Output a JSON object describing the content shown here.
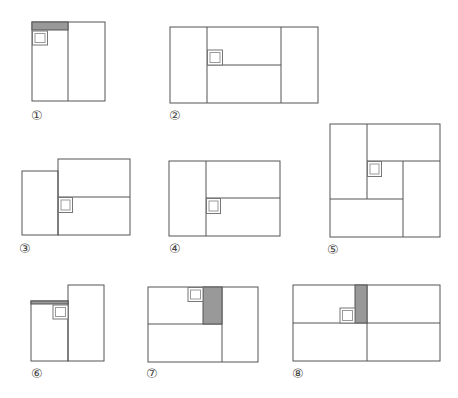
{
  "figures": [
    {
      "label": "①",
      "description": "Two vertical panels with shaded strip across top of left panel and small double square beneath it"
    },
    {
      "label": "②",
      "description": "Three vertical panels; middle panel split horizontally; double square at top-left corner of lower-middle junction"
    },
    {
      "label": "③",
      "description": "Shorter left panel plus right block split horizontally; double square at junction"
    },
    {
      "label": "④",
      "description": "Left panel plus right block split horizontally; double square at junction"
    },
    {
      "label": "⑤",
      "description": "Pinwheel of four rectangles around a central square containing a double square"
    },
    {
      "label": "⑥",
      "description": "Left panel lower than right panel with shaded strip on top of left panel and double square beneath it"
    },
    {
      "label": "⑦",
      "description": "Left block split horizontally with shaded strip at top-right of upper-left cell; double square at top edge"
    },
    {
      "label": "⑧",
      "description": "Four-quadrant grid with shaded strip left of central vertical divider in upper half; double square beside it"
    }
  ],
  "colors": {
    "line": "#555555",
    "shade": "#999999",
    "background": "#ffffff"
  }
}
